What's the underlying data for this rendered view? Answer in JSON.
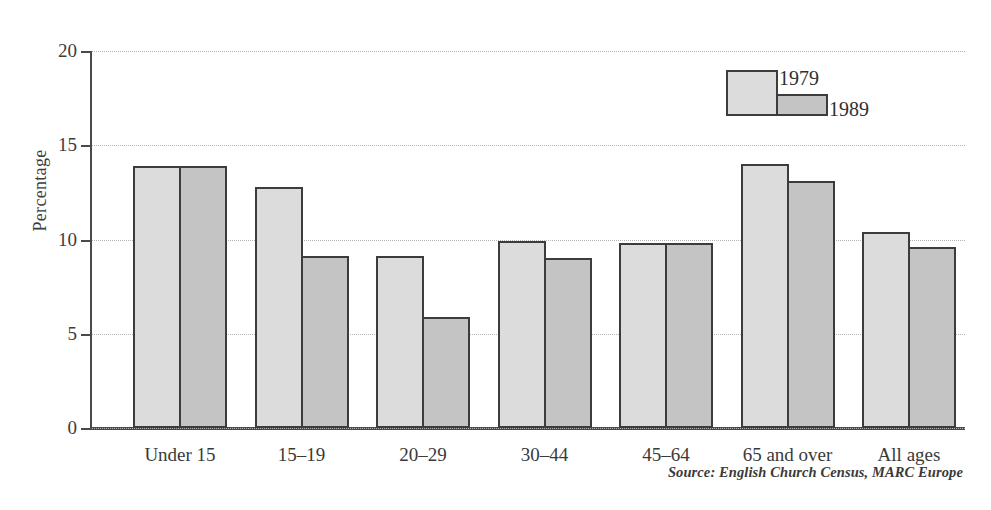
{
  "chart_data": {
    "type": "bar",
    "title": "",
    "subtitle": "",
    "xlabel": "",
    "ylabel": "Percentage",
    "ylim": [
      0,
      20
    ],
    "yticks": [
      0,
      5,
      10,
      15,
      20
    ],
    "ytick_labels": [
      "0",
      "5",
      "10",
      "15",
      "20"
    ],
    "grid": "horizontal-dotted",
    "legend_position": "top-right",
    "categories": [
      "Under 15",
      "15–19",
      "20–29",
      "30–44",
      "45–64",
      "65 and over",
      "All ages"
    ],
    "series": [
      {
        "name": "1979",
        "color": "#dcdcdc",
        "values": [
          13.9,
          12.8,
          9.1,
          9.9,
          9.8,
          14.0,
          10.4
        ]
      },
      {
        "name": "1989",
        "color": "#c4c4c4",
        "values": [
          13.9,
          9.1,
          5.9,
          9.0,
          9.8,
          13.1,
          9.6
        ]
      }
    ],
    "annotations": [
      "Source: English Church Census, MARC Europe"
    ]
  },
  "axis": {
    "y_title": "Percentage",
    "y_ticks": [
      "20",
      "15",
      "10",
      "5",
      "0"
    ]
  },
  "legend": {
    "entries": [
      {
        "label": "1979"
      },
      {
        "label": "1989"
      }
    ]
  },
  "footer": {
    "source": "Source: English Church Census, MARC Europe"
  },
  "colors": {
    "series_1979": "#dcdcdc",
    "series_1989": "#c4c4c4",
    "axis": "#4a4a4a",
    "gridline": "#b4b4b4",
    "bar_outline": "#3c3c3c",
    "background": "#ffffff"
  }
}
